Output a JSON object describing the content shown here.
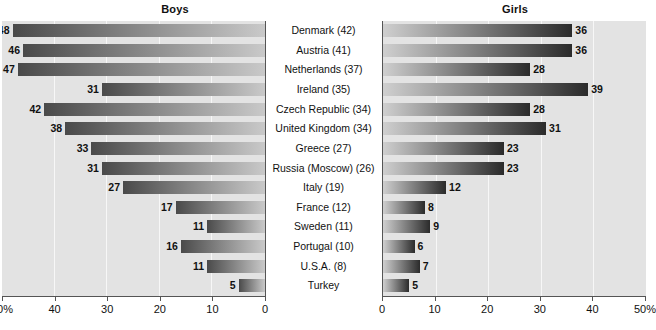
{
  "panels": {
    "left": {
      "title": "Boys"
    },
    "right": {
      "title": "Girls"
    }
  },
  "axis": {
    "left_ticks": [
      "50%",
      "40",
      "30",
      "20",
      "10",
      "0"
    ],
    "right_ticks": [
      "0",
      "10",
      "20",
      "30",
      "40",
      "50%"
    ],
    "max": 50,
    "unit": "%"
  },
  "chart_data": {
    "type": "bar",
    "title": "",
    "subtitle": "",
    "orientation": "horizontal-bidirectional",
    "xlabel": "",
    "ylabel": "",
    "xlim": [
      0,
      50
    ],
    "grid": true,
    "legend": "none",
    "categories": [
      "Denmark (42)",
      "Austria (41)",
      "Netherlands (37)",
      "Ireland (35)",
      "Czech Republic (34)",
      "United Kingdom (34)",
      "Greece (27)",
      "Russia (Moscow) (26)",
      "Italy (19)",
      "France (12)",
      "Sweden (11)",
      "Portugal (10)",
      "U.S.A. (8)",
      "Turkey"
    ],
    "series": [
      {
        "name": "Boys",
        "values": [
          48,
          46,
          47,
          31,
          42,
          38,
          33,
          31,
          27,
          17,
          11,
          16,
          11,
          5
        ]
      },
      {
        "name": "Girls",
        "values": [
          36,
          36,
          28,
          39,
          28,
          31,
          23,
          23,
          12,
          8,
          9,
          6,
          7,
          5
        ]
      }
    ]
  }
}
